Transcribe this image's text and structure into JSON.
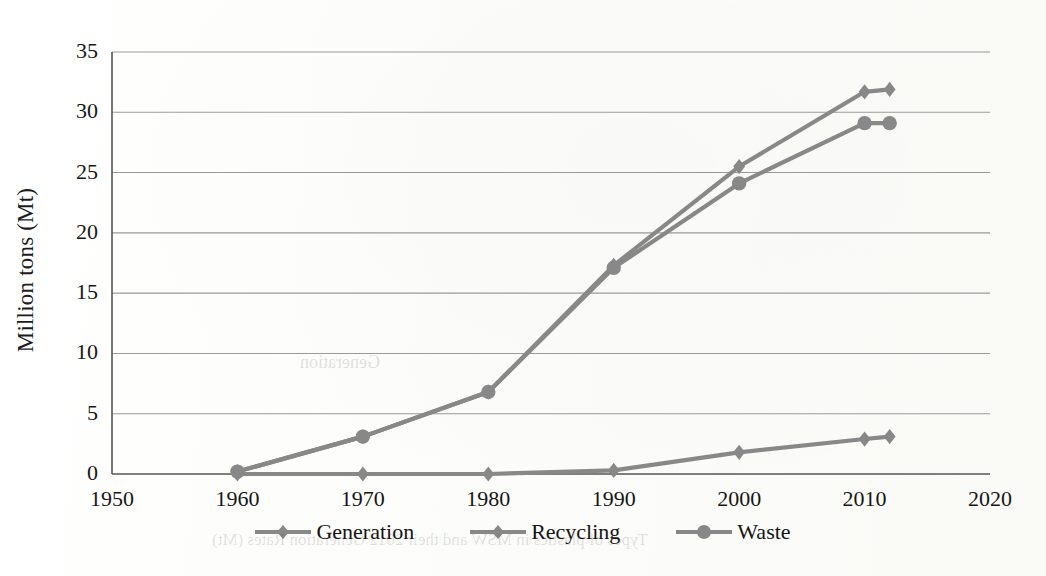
{
  "figure": {
    "background_color": "#fdfdfc",
    "series_color": "#888888",
    "axis_color": "#555555",
    "grid_color": "#9a9a9a",
    "text_color": "#161616"
  },
  "axis": {
    "y_title": "Million tons (Mt)",
    "y_ticks": [
      "0",
      "5",
      "10",
      "15",
      "20",
      "25",
      "30",
      "35"
    ],
    "x_ticks": [
      "1950",
      "1960",
      "1970",
      "1980",
      "1990",
      "2000",
      "2010",
      "2020"
    ]
  },
  "legend": {
    "position": "bottom-center",
    "items": [
      {
        "label": "Generation",
        "marker": "diamond-marker-icon",
        "color": "#888888"
      },
      {
        "label": "Recycling",
        "marker": "diamond-marker-icon",
        "color": "#888888"
      },
      {
        "label": "Waste",
        "marker": "circle-marker-icon",
        "color": "#888888"
      }
    ]
  },
  "ghost_text": {
    "caption": "Types of plastics in MSW and their 2012 Generation Rates (Mt)",
    "mid": "Generation"
  },
  "chart_data": {
    "type": "line",
    "title": "",
    "xlabel": "",
    "ylabel": "Million tons (Mt)",
    "xlim": [
      1950,
      2020
    ],
    "ylim": [
      0,
      35
    ],
    "ytick_step": 5,
    "xtick_step": 10,
    "grid": true,
    "legend_position": "bottom-center",
    "x": [
      1960,
      1970,
      1980,
      1990,
      2000,
      2010,
      2012
    ],
    "series": [
      {
        "name": "Generation",
        "marker": "diamond",
        "color": "#888888",
        "values": [
          0.2,
          3.1,
          6.8,
          17.3,
          25.5,
          31.7,
          31.9
        ]
      },
      {
        "name": "Recycling",
        "marker": "diamond",
        "color": "#888888",
        "values": [
          0.0,
          0.0,
          0.0,
          0.3,
          1.8,
          2.9,
          3.1
        ]
      },
      {
        "name": "Waste",
        "marker": "circle",
        "color": "#888888",
        "values": [
          0.2,
          3.1,
          6.8,
          17.1,
          24.1,
          29.1,
          29.1
        ]
      }
    ]
  }
}
